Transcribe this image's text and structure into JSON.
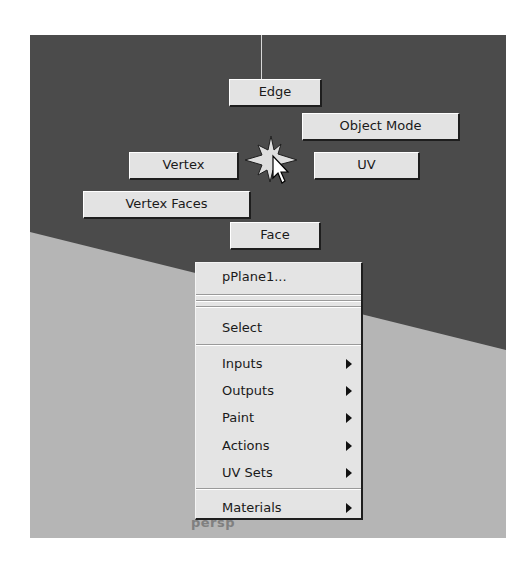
{
  "viewport": {
    "camera_label": "persp",
    "colors": {
      "background": "#4b4b4b",
      "ground_plane": "#b5b5b5",
      "button_face": "#e3e3e3",
      "menu_face": "#e4e4e4"
    }
  },
  "marking_menu": {
    "center_icon": "compass-star-icon",
    "items": {
      "north": "Edge",
      "northeast": "Object Mode",
      "east": "UV",
      "west": "Vertex",
      "southwest": "Vertex Faces",
      "south": "Face"
    }
  },
  "popup_menu": {
    "title_item": "pPlane1...",
    "select_item": "Select",
    "submenus": [
      {
        "label": "Inputs",
        "has_submenu": true
      },
      {
        "label": "Outputs",
        "has_submenu": true
      },
      {
        "label": "Paint",
        "has_submenu": true
      },
      {
        "label": "Actions",
        "has_submenu": true
      },
      {
        "label": "UV Sets",
        "has_submenu": true
      }
    ],
    "bottom_item": {
      "label": "Materials",
      "has_submenu": true
    }
  }
}
